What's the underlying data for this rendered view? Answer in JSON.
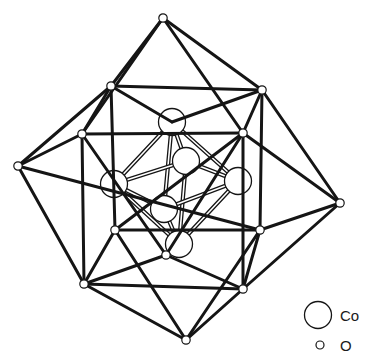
{
  "diagram": {
    "type": "crystal-structure",
    "colors": {
      "ink": "#151515",
      "background": "#ffffff",
      "double_bond_fill": "#ffffff"
    },
    "oxygen_atoms": [
      {
        "id": "o_top",
        "x": 163,
        "y": 18
      },
      {
        "id": "o_ul",
        "x": 111,
        "y": 86
      },
      {
        "id": "o_ur",
        "x": 262,
        "y": 90
      },
      {
        "id": "o_ml",
        "x": 82,
        "y": 134
      },
      {
        "id": "o_mr",
        "x": 243,
        "y": 133
      },
      {
        "id": "o_fl",
        "x": 18,
        "y": 166
      },
      {
        "id": "o_fr",
        "x": 340,
        "y": 203
      },
      {
        "id": "o_ll_in",
        "x": 115,
        "y": 230
      },
      {
        "id": "o_lr_in",
        "x": 260,
        "y": 230
      },
      {
        "id": "o_bc_in",
        "x": 166,
        "y": 255
      },
      {
        "id": "o_ll",
        "x": 84,
        "y": 284
      },
      {
        "id": "o_lr",
        "x": 243,
        "y": 289
      },
      {
        "id": "o_bot",
        "x": 186,
        "y": 340
      }
    ],
    "cobalt_atoms": [
      {
        "id": "co_top",
        "x": 172,
        "y": 122
      },
      {
        "id": "co_back",
        "x": 186,
        "y": 161
      },
      {
        "id": "co_left",
        "x": 114,
        "y": 184
      },
      {
        "id": "co_right",
        "x": 238,
        "y": 181
      },
      {
        "id": "co_front",
        "x": 164,
        "y": 209
      },
      {
        "id": "co_bot",
        "x": 179,
        "y": 244
      }
    ],
    "o_bonds": [
      [
        "o_top",
        "o_ul"
      ],
      [
        "o_top",
        "o_ur"
      ],
      [
        "o_top",
        "o_ml"
      ],
      [
        "o_top",
        "o_mr"
      ],
      [
        "o_ul",
        "o_ur"
      ],
      [
        "o_ul",
        "o_ml"
      ],
      [
        "o_ul",
        "o_fl"
      ],
      [
        "o_ul",
        "o_ll_in"
      ],
      [
        "o_ul",
        "co_top"
      ],
      [
        "o_ur",
        "o_mr"
      ],
      [
        "o_ur",
        "o_fr"
      ],
      [
        "o_ur",
        "o_lr_in"
      ],
      [
        "o_ur",
        "co_top"
      ],
      [
        "o_ml",
        "o_mr"
      ],
      [
        "o_ml",
        "o_fl"
      ],
      [
        "o_ml",
        "o_ll"
      ],
      [
        "o_ml",
        "o_bc_in"
      ],
      [
        "o_mr",
        "o_fr"
      ],
      [
        "o_mr",
        "o_lr"
      ],
      [
        "o_mr",
        "o_bc_in"
      ],
      [
        "o_fl",
        "o_ll"
      ],
      [
        "o_fl",
        "o_lr_in"
      ],
      [
        "o_fr",
        "o_lr"
      ],
      [
        "o_fr",
        "o_lr_in"
      ],
      [
        "o_ll_in",
        "o_lr_in"
      ],
      [
        "o_ll_in",
        "o_ll"
      ],
      [
        "o_ll_in",
        "o_bot"
      ],
      [
        "o_ll_in",
        "o_mr"
      ],
      [
        "o_lr_in",
        "o_lr"
      ],
      [
        "o_lr_in",
        "o_bot"
      ],
      [
        "o_ll",
        "o_lr"
      ],
      [
        "o_ll",
        "o_bc_in"
      ],
      [
        "o_ll",
        "o_bot"
      ],
      [
        "o_lr",
        "o_bc_in"
      ],
      [
        "o_lr",
        "o_bot"
      ]
    ],
    "co_bonds": [
      [
        "co_top",
        "co_back"
      ],
      [
        "co_top",
        "co_left"
      ],
      [
        "co_top",
        "co_right"
      ],
      [
        "co_top",
        "co_front"
      ],
      [
        "co_bot",
        "co_back"
      ],
      [
        "co_bot",
        "co_left"
      ],
      [
        "co_bot",
        "co_right"
      ],
      [
        "co_bot",
        "co_front"
      ],
      [
        "co_left",
        "co_back"
      ],
      [
        "co_back",
        "co_right"
      ],
      [
        "co_right",
        "co_front"
      ],
      [
        "co_front",
        "co_left"
      ]
    ]
  },
  "legend": {
    "items": [
      {
        "symbol": "large-circle",
        "label": "Co"
      },
      {
        "symbol": "small-circle",
        "label": "O"
      }
    ]
  }
}
